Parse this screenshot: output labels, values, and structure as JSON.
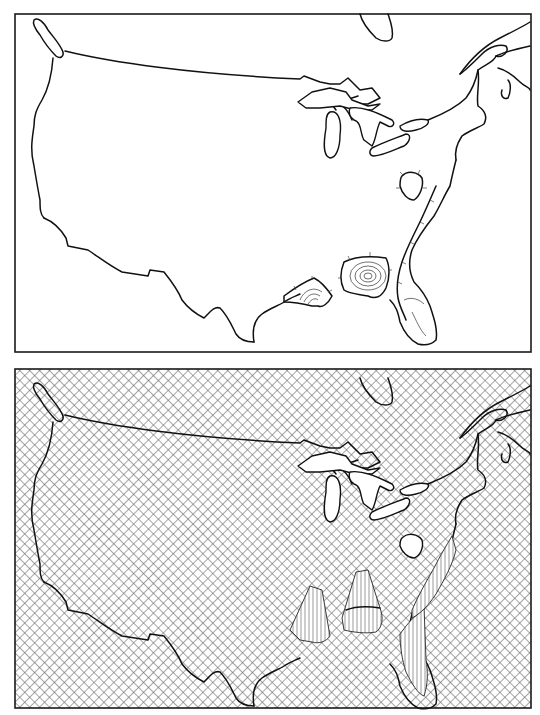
{
  "figure": {
    "panels": [
      {
        "id": "top",
        "type": "contour-map",
        "description": "Outline map of the United States with contour regions",
        "frame": {
          "x": 15,
          "y": 14,
          "width": 516,
          "height": 338
        },
        "regions": [
          {
            "name": "tennessee-oval",
            "type": "closed-contour"
          },
          {
            "name": "atlantic-coastal-plain",
            "type": "contour-band"
          },
          {
            "name": "alabama-georgia-peak",
            "type": "concentric-contours",
            "rings": 5
          },
          {
            "name": "louisiana-mississippi-peak",
            "type": "concentric-contours",
            "rings": 4
          },
          {
            "name": "florida-peninsula",
            "type": "contour-band"
          }
        ]
      },
      {
        "id": "bottom",
        "type": "3d-surface-map",
        "description": "Cross-hatched perspective surface plot of the same map with peaks",
        "frame": {
          "x": 15,
          "y": 369,
          "width": 516,
          "height": 339
        },
        "pattern": "crosshatch",
        "peaks": [
          {
            "name": "louisiana-peak",
            "relative_height": "medium"
          },
          {
            "name": "alabama-peak",
            "relative_height": "high"
          },
          {
            "name": "florida-peak",
            "relative_height": "low"
          }
        ]
      }
    ],
    "colors": {
      "ink": "#111111",
      "background": "#ffffff",
      "hatch": "#6a6a6a"
    }
  }
}
